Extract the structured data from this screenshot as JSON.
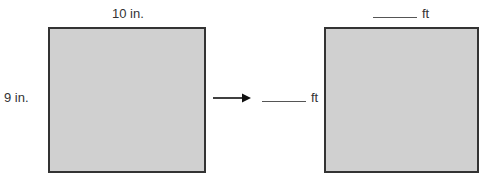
{
  "left_figure": {
    "top_label": "10 in.",
    "side_label": "9 in."
  },
  "arrow": {
    "direction": "right"
  },
  "right_figure": {
    "top_label_unit": "ft",
    "side_label_unit": "ft"
  }
}
